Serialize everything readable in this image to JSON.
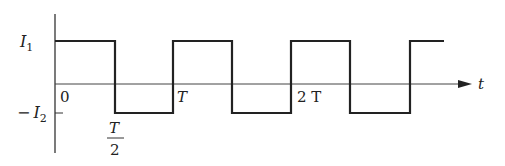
{
  "diagram": {
    "type": "square-wave",
    "y_axis": {
      "labels": {
        "high": "I",
        "high_sub": "1",
        "low_minus": "−",
        "low": "I",
        "low_sub": "2"
      }
    },
    "x_axis": {
      "name": "t",
      "ticks": {
        "origin": "0",
        "half_num": "T",
        "half_den": "2",
        "period": "T",
        "two_period": "2 T"
      }
    },
    "levels": {
      "high": "I1",
      "low": "-I2"
    },
    "edges_x": [
      115,
      173,
      232,
      291,
      350,
      410
    ],
    "colors": {
      "line": "#222222",
      "axis": "#333333",
      "background": "#ffffff"
    }
  }
}
